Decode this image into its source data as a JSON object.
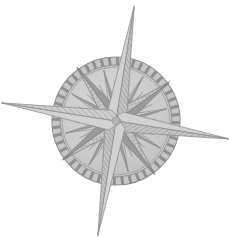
{
  "figure": {
    "kind": "compass-rose-illustration"
  },
  "canvas": {
    "width": 229,
    "height": 237,
    "background": "#ffffff"
  },
  "palette": {
    "background": "#ffffff",
    "ring_fill": "#c3c3c3",
    "ring_stroke": "#9a9a9a",
    "ring_inner_fill": "#cfcfcf",
    "tick_dark": "#8f8f8f",
    "tick_light": "#d6d6d6",
    "point_light": "#cbcbcb",
    "point_dark": "#8e8e8e",
    "point_mid": "#a8a8a8",
    "outline": "#7d7d7d",
    "hatch_line": "#9d9d9d"
  },
  "geometry": {
    "center_x": 116,
    "center_y": 121,
    "rotation_deg": 9,
    "ring_outer_radius": 64,
    "ring_band_inner_radius": 56,
    "ring_inner_disc_radius": 54,
    "tick_count": 48,
    "cardinal_spike_length": 116,
    "cardinal_spike_half_width": 9,
    "ordinal_spike_length": 64,
    "ordinal_spike_half_width": 8,
    "secondary_spike_length": 50,
    "secondary_spike_half_width": 5,
    "tertiary_spike_length": 36,
    "tertiary_spike_half_width": 4
  },
  "points": {
    "cardinal": [
      {
        "name": "north",
        "angle_deg": 0,
        "length": 116
      },
      {
        "name": "east",
        "angle_deg": 90,
        "length": 116
      },
      {
        "name": "south",
        "angle_deg": 180,
        "length": 116
      },
      {
        "name": "west",
        "angle_deg": 270,
        "length": 116
      }
    ],
    "ordinal": [
      {
        "name": "northeast",
        "angle_deg": 45,
        "length": 64
      },
      {
        "name": "southeast",
        "angle_deg": 135,
        "length": 64
      },
      {
        "name": "southwest",
        "angle_deg": 225,
        "length": 64
      },
      {
        "name": "northwest",
        "angle_deg": 315,
        "length": 64
      }
    ],
    "secondary": [
      {
        "name": "north-northeast",
        "angle_deg": 22.5,
        "length": 50
      },
      {
        "name": "east-northeast",
        "angle_deg": 67.5,
        "length": 50
      },
      {
        "name": "east-southeast",
        "angle_deg": 112.5,
        "length": 50
      },
      {
        "name": "south-southeast",
        "angle_deg": 157.5,
        "length": 50
      },
      {
        "name": "south-southwest",
        "angle_deg": 202.5,
        "length": 50
      },
      {
        "name": "west-southwest",
        "angle_deg": 247.5,
        "length": 50
      },
      {
        "name": "west-northwest",
        "angle_deg": 292.5,
        "length": 50
      },
      {
        "name": "north-northwest",
        "angle_deg": 337.5,
        "length": 50
      }
    ]
  },
  "labels": {
    "north": "",
    "east": "",
    "south": "",
    "west": ""
  }
}
